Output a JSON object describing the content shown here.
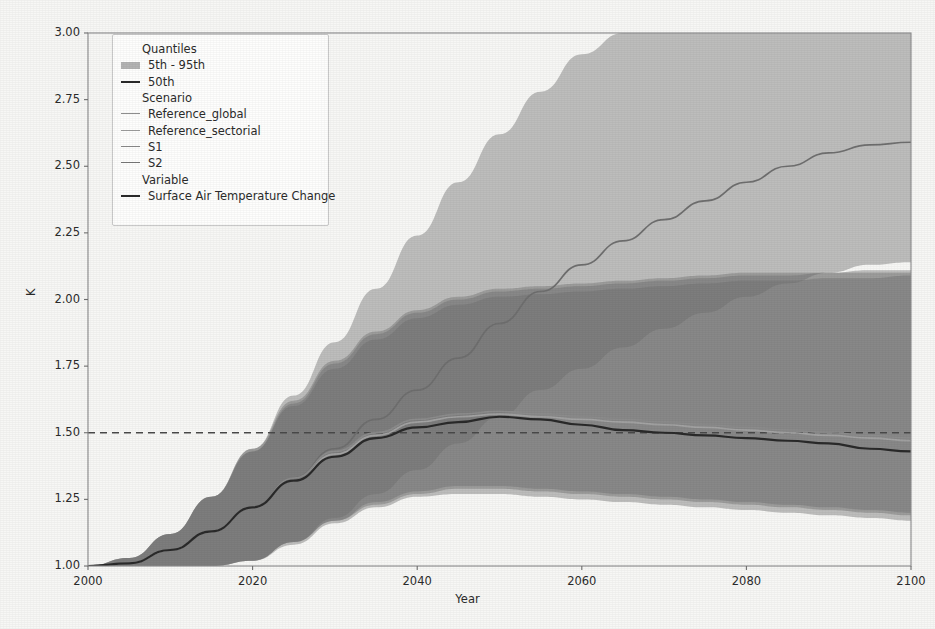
{
  "chart_data": {
    "type": "area",
    "title": "",
    "xlabel": "Year",
    "ylabel": "K",
    "xlim": [
      2000,
      2100
    ],
    "ylim": [
      1.0,
      3.0
    ],
    "xticks": [
      2000,
      2020,
      2040,
      2060,
      2080,
      2100
    ],
    "xtick_labels": [
      "2000",
      "2020",
      "2040",
      "2060",
      "2080",
      "2100"
    ],
    "yticks": [
      1.0,
      1.25,
      1.5,
      1.75,
      2.0,
      2.25,
      2.5,
      2.75,
      3.0
    ],
    "ytick_labels": [
      "1.00",
      "1.25",
      "1.50",
      "1.75",
      "2.00",
      "2.25",
      "2.50",
      "2.75",
      "3.00"
    ],
    "grid": false,
    "legend_position": "upper-left",
    "reference_line": {
      "value": 1.5,
      "style": "dashed",
      "color": "#4a4a4a"
    },
    "x": [
      2000,
      2005,
      2010,
      2015,
      2020,
      2025,
      2030,
      2035,
      2040,
      2045,
      2050,
      2055,
      2060,
      2065,
      2070,
      2075,
      2080,
      2085,
      2090,
      2095,
      2100
    ],
    "series": [
      {
        "name": "Reference_global",
        "variable": "Surface Air Temperature Change",
        "quantile": "50th",
        "color": "#6f6f6f",
        "values": [
          1.0,
          1.01,
          1.06,
          1.13,
          1.22,
          1.33,
          1.44,
          1.55,
          1.66,
          1.78,
          1.91,
          2.03,
          2.13,
          2.22,
          2.3,
          2.37,
          2.44,
          2.5,
          2.55,
          2.58,
          2.59
        ],
        "band_5th": [
          1.0,
          1.0,
          1.0,
          1.0,
          1.02,
          1.09,
          1.18,
          1.27,
          1.36,
          1.46,
          1.56,
          1.66,
          1.74,
          1.82,
          1.89,
          1.95,
          2.01,
          2.06,
          2.1,
          2.13,
          2.14
        ],
        "band_95th": [
          1.0,
          1.03,
          1.12,
          1.26,
          1.44,
          1.64,
          1.84,
          2.04,
          2.24,
          2.44,
          2.62,
          2.78,
          2.92,
          3.0,
          3.0,
          3.0,
          3.0,
          3.0,
          3.0,
          3.0,
          3.0
        ]
      },
      {
        "name": "Reference_sectorial",
        "variable": "Surface Air Temperature Change",
        "quantile": "50th",
        "color": "#8c8c8c",
        "values": [
          1.0,
          1.01,
          1.06,
          1.13,
          1.22,
          1.33,
          1.43,
          1.5,
          1.55,
          1.57,
          1.58,
          1.57,
          1.56,
          1.55,
          1.54,
          1.53,
          1.52,
          1.51,
          1.5,
          1.49,
          1.48
        ],
        "band_5th": [
          1.0,
          1.0,
          1.0,
          1.0,
          1.02,
          1.09,
          1.17,
          1.24,
          1.28,
          1.3,
          1.3,
          1.29,
          1.28,
          1.27,
          1.26,
          1.25,
          1.24,
          1.23,
          1.22,
          1.21,
          1.2
        ],
        "band_95th": [
          1.0,
          1.03,
          1.12,
          1.26,
          1.44,
          1.62,
          1.77,
          1.88,
          1.96,
          2.01,
          2.04,
          2.05,
          2.06,
          2.07,
          2.08,
          2.09,
          2.1,
          2.1,
          2.1,
          2.11,
          2.11
        ]
      },
      {
        "name": "S1",
        "variable": "Surface Air Temperature Change",
        "quantile": "50th",
        "color": "#a3a3a3",
        "values": [
          1.0,
          1.01,
          1.06,
          1.13,
          1.22,
          1.32,
          1.42,
          1.49,
          1.54,
          1.56,
          1.57,
          1.56,
          1.55,
          1.54,
          1.53,
          1.52,
          1.51,
          1.5,
          1.49,
          1.48,
          1.47
        ],
        "band_5th": [
          1.0,
          1.0,
          1.0,
          1.0,
          1.02,
          1.09,
          1.17,
          1.23,
          1.27,
          1.29,
          1.29,
          1.28,
          1.27,
          1.26,
          1.25,
          1.24,
          1.23,
          1.22,
          1.21,
          1.2,
          1.19
        ],
        "band_95th": [
          1.0,
          1.03,
          1.12,
          1.26,
          1.43,
          1.61,
          1.76,
          1.87,
          1.95,
          2.0,
          2.03,
          2.04,
          2.05,
          2.06,
          2.07,
          2.08,
          2.09,
          2.09,
          2.1,
          2.1,
          2.1
        ]
      },
      {
        "name": "S2",
        "variable": "Surface Air Temperature Change",
        "quantile": "50th",
        "color": "#2a2a2a",
        "values": [
          1.0,
          1.01,
          1.06,
          1.13,
          1.22,
          1.32,
          1.41,
          1.48,
          1.52,
          1.54,
          1.56,
          1.55,
          1.53,
          1.51,
          1.5,
          1.49,
          1.48,
          1.47,
          1.46,
          1.44,
          1.43
        ],
        "band_5th": [
          1.0,
          1.0,
          1.0,
          1.0,
          1.02,
          1.08,
          1.16,
          1.22,
          1.26,
          1.27,
          1.27,
          1.26,
          1.25,
          1.24,
          1.23,
          1.22,
          1.21,
          1.2,
          1.19,
          1.18,
          1.17
        ],
        "band_95th": [
          1.0,
          1.03,
          1.12,
          1.26,
          1.43,
          1.6,
          1.74,
          1.85,
          1.93,
          1.98,
          2.01,
          2.02,
          2.03,
          2.04,
          2.05,
          2.06,
          2.07,
          2.07,
          2.08,
          2.08,
          2.09
        ]
      }
    ]
  },
  "legend": {
    "groups": [
      {
        "title": "Quantiles",
        "entries": [
          {
            "label": "5th - 95th",
            "key": "patch",
            "color": "#9a9a9a"
          },
          {
            "label": "50th",
            "key": "line-thick",
            "color": "#2a2a2a"
          }
        ]
      },
      {
        "title": "Scenario",
        "entries": [
          {
            "label": "Reference_global",
            "key": "line",
            "color": "#8e8e8e"
          },
          {
            "label": "Reference_sectorial",
            "key": "line",
            "color": "#9d9d9d"
          },
          {
            "label": "S1",
            "key": "line",
            "color": "#8a8a8a"
          },
          {
            "label": "S2",
            "key": "line",
            "color": "#777777"
          }
        ]
      },
      {
        "title": "Variable",
        "entries": [
          {
            "label": "Surface Air Temperature Change",
            "key": "line-thick",
            "color": "#2a2a2a"
          }
        ]
      }
    ]
  }
}
